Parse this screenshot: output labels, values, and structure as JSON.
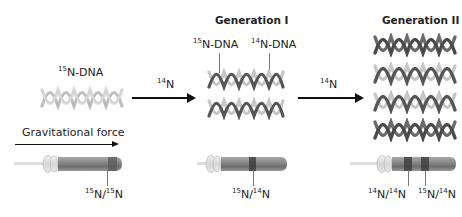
{
  "parent": {
    "label_mass": "15",
    "label_text": "N-DNA",
    "strand_colors": [
      "#c8c8c8",
      "#b0b0b0"
    ]
  },
  "arrow1": {
    "mass": "14",
    "text": "N"
  },
  "arrow2": {
    "mass": "14",
    "text": "N"
  },
  "generation1": {
    "title": "Generation I",
    "label_heavy_mass": "15",
    "label_heavy_text": "N-DNA",
    "label_light_mass": "14",
    "label_light_text": "N-DNA",
    "helix_count": 2
  },
  "generation2": {
    "title": "Generation II",
    "helix_count": 4
  },
  "gravity": {
    "label": "Gravitational force"
  },
  "tubes": [
    {
      "band_label": {
        "m1": "15",
        "t1": "N/",
        "m2": "15",
        "t2": "N"
      }
    },
    {
      "band_label": {
        "m1": "15",
        "t1": "N/",
        "m2": "14",
        "t2": "N"
      }
    },
    {
      "band_labels": [
        {
          "m1": "14",
          "t1": "N/",
          "m2": "14",
          "t2": "N"
        },
        {
          "m1": "15",
          "t1": "N/",
          "m2": "14",
          "t2": "N"
        }
      ]
    }
  ],
  "colors": {
    "heavy_strand": "#c4c4c4",
    "light_strand": "#555555",
    "tube_body": "#7a7a7a",
    "band": "#3f3f3f",
    "arrow": "#111111"
  }
}
